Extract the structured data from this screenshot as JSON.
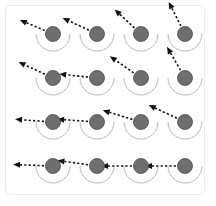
{
  "figure": {
    "title": "",
    "frame": {
      "border_color": "#ececec",
      "background_color": "#ffffff",
      "x": 5,
      "y": 5,
      "width": 200,
      "height": 190,
      "corner_radius": 5
    },
    "style": {
      "circle_fill": "#6e6e6e",
      "circle_stroke": "#4a4a4a",
      "circle_radius": 7.5,
      "arc_stroke": "#b8b8b8",
      "arc_radius": 17,
      "arc_stroke_width": 1,
      "vector_color": "#111111",
      "vector_stroke_width": 1.6,
      "vector_dash": "2.2 2.2",
      "arrowhead_length": 7,
      "arrowhead_width": 6
    },
    "grid": {
      "rows": 4,
      "cols": 4,
      "col_x": [
        53,
        97,
        141,
        185
      ],
      "row_y": [
        34,
        78,
        122,
        166
      ],
      "row_labels": [
        "row-1",
        "row-2",
        "row-3",
        "row-4"
      ],
      "col_labels": [
        "col-1",
        "col-2",
        "col-3",
        "col-4"
      ]
    }
  },
  "chart_data": {
    "type": "scatter",
    "title": "",
    "subtitle": "",
    "xlabel": "",
    "ylabel": "",
    "grid": false,
    "legend": null,
    "xlim": [
      0,
      216
    ],
    "ylim": [
      0,
      206
    ],
    "categories": [
      "col-1",
      "col-2",
      "col-3",
      "col-4"
    ],
    "series": [
      {
        "name": "row-1",
        "points": [
          {
            "id": "r1c1",
            "cx": 53,
            "cy": 34,
            "vector_angle_deg": 203,
            "vector_length": 36,
            "arc_start_deg": 0,
            "arc_end_deg": 180
          },
          {
            "id": "r1c2",
            "cx": 97,
            "cy": 34,
            "vector_angle_deg": 205,
            "vector_length": 38,
            "arc_start_deg": 0,
            "arc_end_deg": 180
          },
          {
            "id": "r1c3",
            "cx": 141,
            "cy": 34,
            "vector_angle_deg": 223,
            "vector_length": 36,
            "arc_start_deg": 0,
            "arc_end_deg": 180
          },
          {
            "id": "r1c4",
            "cx": 185,
            "cy": 34,
            "vector_angle_deg": 243,
            "vector_length": 36,
            "arc_start_deg": 0,
            "arc_end_deg": 180
          }
        ]
      },
      {
        "name": "row-2",
        "points": [
          {
            "id": "r2c1",
            "cx": 53,
            "cy": 78,
            "vector_angle_deg": 205,
            "vector_length": 38,
            "arc_start_deg": 0,
            "arc_end_deg": 180
          },
          {
            "id": "r2c2",
            "cx": 97,
            "cy": 78,
            "vector_angle_deg": 186,
            "vector_length": 38,
            "arc_start_deg": 0,
            "arc_end_deg": 180
          },
          {
            "id": "r2c3",
            "cx": 141,
            "cy": 78,
            "vector_angle_deg": 215,
            "vector_length": 38,
            "arc_start_deg": 0,
            "arc_end_deg": 180
          },
          {
            "id": "r2c4",
            "cx": 185,
            "cy": 78,
            "vector_angle_deg": 240,
            "vector_length": 36,
            "arc_start_deg": 0,
            "arc_end_deg": 180
          }
        ]
      },
      {
        "name": "row-3",
        "points": [
          {
            "id": "r3c1",
            "cx": 53,
            "cy": 122,
            "vector_angle_deg": 184,
            "vector_length": 38,
            "arc_start_deg": 0,
            "arc_end_deg": 180
          },
          {
            "id": "r3c2",
            "cx": 97,
            "cy": 122,
            "vector_angle_deg": 184,
            "vector_length": 40,
            "arc_start_deg": 0,
            "arc_end_deg": 180
          },
          {
            "id": "r3c3",
            "cx": 141,
            "cy": 122,
            "vector_angle_deg": 197,
            "vector_length": 40,
            "arc_start_deg": 0,
            "arc_end_deg": 180
          },
          {
            "id": "r3c4",
            "cx": 185,
            "cy": 122,
            "vector_angle_deg": 205,
            "vector_length": 40,
            "arc_start_deg": 0,
            "arc_end_deg": 180
          }
        ]
      },
      {
        "name": "row-4",
        "points": [
          {
            "id": "r4c1",
            "cx": 53,
            "cy": 166,
            "vector_angle_deg": 182,
            "vector_length": 40,
            "arc_start_deg": 0,
            "arc_end_deg": 180
          },
          {
            "id": "r4c2",
            "cx": 97,
            "cy": 166,
            "vector_angle_deg": 188,
            "vector_length": 40,
            "arc_start_deg": 0,
            "arc_end_deg": 180
          },
          {
            "id": "r4c3",
            "cx": 141,
            "cy": 166,
            "vector_angle_deg": 180,
            "vector_length": 40,
            "arc_start_deg": 0,
            "arc_end_deg": 180
          },
          {
            "id": "r4c4",
            "cx": 185,
            "cy": 166,
            "vector_angle_deg": 180,
            "vector_length": 40,
            "arc_start_deg": 0,
            "arc_end_deg": 180
          }
        ]
      }
    ]
  }
}
